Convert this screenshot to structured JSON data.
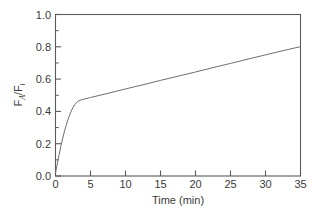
{
  "chart_data": {
    "type": "line",
    "title": "",
    "xlabel": "Time (min)",
    "ylabel": "F_A/F_i",
    "ylabel_parts": {
      "main1": "F",
      "sub1": "A",
      "slash": "/F",
      "sub2": "i"
    },
    "xlim": [
      0,
      35
    ],
    "ylim": [
      0.0,
      1.0
    ],
    "xticks": [
      0,
      5,
      10,
      15,
      20,
      25,
      30,
      35
    ],
    "xtick_labels": [
      "0",
      "5",
      "10",
      "15",
      "20",
      "25",
      "30",
      "35"
    ],
    "yticks": [
      0.0,
      0.2,
      0.4,
      0.6,
      0.8,
      1.0
    ],
    "ytick_labels": [
      "0.0",
      "0.2",
      "0.4",
      "0.6",
      "0.8",
      "1.0"
    ],
    "yticks_minor": [
      0.1,
      0.3,
      0.5,
      0.7,
      0.9
    ],
    "grid": false,
    "legend": false,
    "legend_position": "none",
    "series": [
      {
        "name": "FA/Fi vs time",
        "color": "#6e6e6e",
        "x": [
          0.0,
          0.25,
          0.5,
          0.75,
          1.0,
          1.25,
          1.5,
          1.75,
          2.0,
          2.25,
          2.5,
          2.75,
          3.0,
          3.25,
          3.5,
          3.75,
          5.0,
          7.5,
          10.0,
          12.5,
          15.0,
          17.5,
          20.0,
          22.5,
          25.0,
          27.5,
          30.0,
          32.5,
          35.0
        ],
        "y": [
          0.02,
          0.075,
          0.13,
          0.182,
          0.229,
          0.272,
          0.311,
          0.345,
          0.376,
          0.402,
          0.425,
          0.442,
          0.455,
          0.464,
          0.469,
          0.472,
          0.486,
          0.512,
          0.539,
          0.565,
          0.592,
          0.618,
          0.644,
          0.671,
          0.697,
          0.724,
          0.75,
          0.776,
          0.801
        ]
      }
    ],
    "annotations": []
  },
  "axes_colors": {
    "frame": "#5a5a5a",
    "curve": "#6e6e6e",
    "text": "#3a3a3a",
    "background": "#ffffff"
  }
}
